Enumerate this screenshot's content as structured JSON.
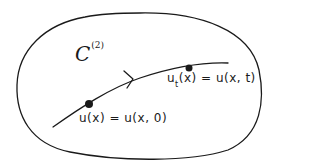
{
  "diagram": {
    "set": {
      "symbol": "C",
      "superscript": "(2)"
    },
    "start_point": {
      "label": "u(x) = u(x, 0)"
    },
    "end_point": {
      "label_base": "u",
      "label_sub": "t",
      "label_rest": "(x) = u(x, t)"
    },
    "colors": {
      "ink": "#1a1a1a",
      "background": "#ffffff"
    }
  }
}
